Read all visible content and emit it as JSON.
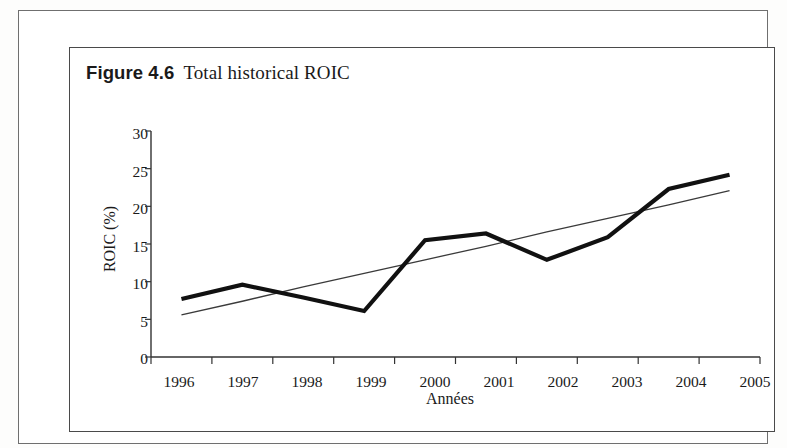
{
  "figure": {
    "label": "Figure 4.6",
    "title": "Total historical ROIC"
  },
  "colors": {
    "series_line": "#111111",
    "trend_line": "#3a3a3a",
    "axis": "#333333",
    "frame": "#4a4a4a",
    "page_frame": "#6f6f6f",
    "text": "#1a1a1a"
  },
  "chart_data": {
    "type": "line",
    "title": "Total historical ROIC",
    "xlabel": "Années",
    "ylabel": "ROIC (%)",
    "categories": [
      "1996",
      "1997",
      "1998",
      "1999",
      "2000",
      "2001",
      "2002",
      "2003",
      "2004",
      "2005"
    ],
    "x": [
      1996,
      1997,
      1998,
      1999,
      2000,
      2001,
      2002,
      2003,
      2004,
      2005
    ],
    "ylim": [
      0,
      30
    ],
    "yticks": [
      0,
      5,
      10,
      15,
      20,
      25,
      30
    ],
    "ytick_labels": [
      "0",
      "5",
      "10",
      "15",
      "20",
      "25",
      "30"
    ],
    "xtick_labels": [
      "1996",
      "1997",
      "1998",
      "1999",
      "2000",
      "2001",
      "2002",
      "2003",
      "2004",
      "2005"
    ],
    "grid": false,
    "legend": "none",
    "series": [
      {
        "name": "ROIC",
        "type": "line",
        "style": "thick",
        "values": [
          7.7,
          9.6,
          7.9,
          6.1,
          15.5,
          16.4,
          12.9,
          15.9,
          22.3,
          24.2
        ]
      },
      {
        "name": "Tendance",
        "type": "trendline",
        "style": "thin",
        "values": [
          5.6,
          7.4,
          9.3,
          11.1,
          12.9,
          14.7,
          16.6,
          18.4,
          20.2,
          22.1
        ]
      }
    ]
  }
}
